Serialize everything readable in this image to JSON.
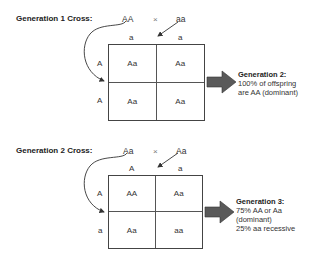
{
  "generation1": {
    "title": "Generation 1 Cross:",
    "parent1": "AA",
    "cross_symbol": "×",
    "parent2": "aa",
    "column_alleles": [
      "a",
      "a"
    ],
    "row_alleles": [
      "A",
      "A"
    ],
    "cells": [
      [
        "Aa",
        "Aa"
      ],
      [
        "Aa",
        "Aa"
      ]
    ],
    "result": {
      "title": "Generation 2:",
      "lines": [
        "100% of offspring",
        "are AA (dominant)"
      ]
    }
  },
  "generation2": {
    "title": "Generation 2 Cross:",
    "parent1": "Aa",
    "cross_symbol": "×",
    "parent2": "Aa",
    "column_alleles": [
      "A",
      "a"
    ],
    "row_alleles": [
      "A",
      "a"
    ],
    "cells": [
      [
        "AA",
        "Aa"
      ],
      [
        "Aa",
        "aa"
      ]
    ],
    "result": {
      "title": "Generation 3:",
      "lines": [
        "75% AA or Aa",
        "(dominant)",
        "25% aa recessive"
      ]
    }
  },
  "colors": {
    "arrow_fill": "#5a5a5a",
    "grid_line": "#444444",
    "text": "#333333"
  }
}
